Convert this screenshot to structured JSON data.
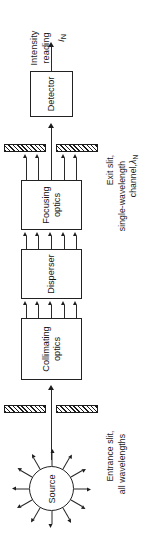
{
  "diagram": {
    "orientation": "rotated-90-ccw",
    "flow_direction": "bottom-to-top",
    "ink_color": "#1c1c1c",
    "background_color": "#ffffff"
  },
  "output": {
    "line1": "Intensity",
    "line2": "reading",
    "symbol": "I",
    "symbol_subscript": "N"
  },
  "blocks": [
    {
      "id": "detector",
      "label": "Detector",
      "label_line1": "Detector",
      "label_line2": ""
    },
    {
      "id": "focusing-optics",
      "label": "Focusing optics",
      "label_line1": "Focusing",
      "label_line2": "optics"
    },
    {
      "id": "disperser",
      "label": "Disperser",
      "label_line1": "Disperser",
      "label_line2": ""
    },
    {
      "id": "collimating-optics",
      "label": "Collimating optics",
      "label_line1": "Collimating",
      "label_line2": "optics"
    }
  ],
  "slits": [
    {
      "id": "exit-slit",
      "caption_line1": "Exit slit,",
      "caption_line2": "single-wavelength",
      "caption_line3": "channel,",
      "symbol": "λ",
      "symbol_subscript": "N"
    },
    {
      "id": "entrance-slit",
      "caption_line1": "Entrance slit,",
      "caption_line2": "all wavelengths",
      "caption_line3": "",
      "symbol": "",
      "symbol_subscript": ""
    }
  ],
  "source": {
    "label": "Source",
    "ray_count": 12
  },
  "beam_groups": {
    "dispersed_ray_count": 5,
    "exit_ray_count": 4,
    "single_ray_count": 1
  }
}
